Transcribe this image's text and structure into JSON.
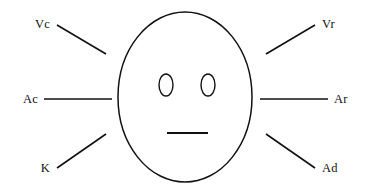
{
  "diagram": {
    "type": "line-diagram",
    "background_color": "#ffffff",
    "stroke_color": "#111111",
    "face": {
      "shape": "ellipse",
      "center_x": 185,
      "center_y": 97,
      "radius_x": 67,
      "radius_y": 85
    },
    "eyes": [
      {
        "name": "left-eye",
        "center_x": 166,
        "center_y": 85,
        "radius_x": 7,
        "radius_y": 11
      },
      {
        "name": "right-eye",
        "center_x": 208,
        "center_y": 85,
        "radius_x": 7,
        "radius_y": 11
      }
    ],
    "mouth": {
      "x1": 167,
      "y1": 133,
      "x2": 208,
      "y2": 133
    },
    "cues": [
      {
        "id": "vc",
        "label": "Vc",
        "side": "left",
        "position": "upper",
        "line": {
          "x1": 57,
          "y1": 25,
          "x2": 106,
          "y2": 54
        },
        "label_x": 50,
        "label_y": 28
      },
      {
        "id": "ac",
        "label": "Ac",
        "side": "left",
        "position": "middle",
        "line": {
          "x1": 44,
          "y1": 99,
          "x2": 112,
          "y2": 99
        },
        "label_x": 38,
        "label_y": 103
      },
      {
        "id": "k",
        "label": "K",
        "side": "left",
        "position": "lower",
        "line": {
          "x1": 57,
          "y1": 168,
          "x2": 106,
          "y2": 134
        },
        "label_x": 50,
        "label_y": 172
      },
      {
        "id": "vr",
        "label": "Vr",
        "side": "right",
        "position": "upper",
        "line": {
          "x1": 266,
          "y1": 54,
          "x2": 315,
          "y2": 25
        },
        "label_x": 322,
        "label_y": 28
      },
      {
        "id": "ar",
        "label": "Ar",
        "side": "right",
        "position": "middle",
        "line": {
          "x1": 260,
          "y1": 99,
          "x2": 328,
          "y2": 99
        },
        "label_x": 334,
        "label_y": 103
      },
      {
        "id": "ad",
        "label": "Ad",
        "side": "right",
        "position": "lower",
        "line": {
          "x1": 266,
          "y1": 134,
          "x2": 315,
          "y2": 168
        },
        "label_x": 322,
        "label_y": 172
      }
    ]
  }
}
